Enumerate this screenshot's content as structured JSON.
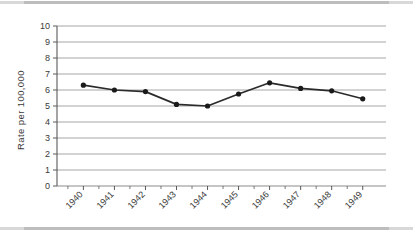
{
  "chart_data": {
    "type": "line",
    "title": "",
    "subtitle": "",
    "xlabel": "",
    "ylabel": "Rate per 100,000",
    "categories": [
      "1940",
      "1941",
      "1942",
      "1943",
      "1944",
      "1945",
      "1946",
      "1947",
      "1948",
      "1949"
    ],
    "values": [
      6.3,
      6.0,
      5.9,
      5.1,
      5.0,
      5.75,
      6.45,
      6.1,
      5.95,
      5.45
    ],
    "series": [
      {
        "name": "Rate per 100,000",
        "values": [
          6.3,
          6.0,
          5.9,
          5.1,
          5.0,
          5.75,
          6.45,
          6.1,
          5.95,
          5.45
        ]
      }
    ],
    "ylim": [
      0,
      10
    ],
    "ytick_labels": [
      "0",
      "1",
      "2",
      "3",
      "4",
      "5",
      "6",
      "7",
      "8",
      "9",
      "10"
    ],
    "ytick_values": [
      0,
      1,
      2,
      3,
      4,
      5,
      6,
      7,
      8,
      9,
      10
    ],
    "xtick_labels": [
      "1940",
      "1941",
      "1942",
      "1943",
      "1944",
      "1945",
      "1946",
      "1947",
      "1948",
      "1949"
    ],
    "grid": "horizontal",
    "legend": "none",
    "legend_position": "none",
    "marker": "circle",
    "line_color": "#2b2b2b",
    "marker_color": "#1a1a1a",
    "grid_color": "#a6a6a6",
    "axis_color": "#595959",
    "background_color": "#ffffff",
    "xtick_label_rotation": -45
  }
}
